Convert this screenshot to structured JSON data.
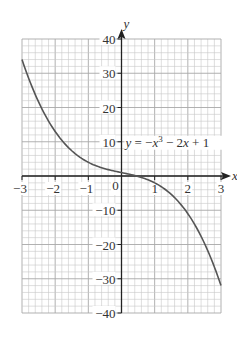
{
  "chart_data": {
    "type": "line",
    "title": "",
    "xlabel": "x",
    "ylabel": "y",
    "xlim": [
      -3,
      3
    ],
    "ylim": [
      -40,
      40
    ],
    "grid": true,
    "grid_minor_x": 0.2,
    "grid_minor_y": 2,
    "x_ticks": [
      -3,
      -2,
      -1,
      0,
      1,
      2,
      3
    ],
    "x_tick_labels": [
      "−3",
      "−2",
      "−1",
      "0",
      "1",
      "2",
      "3"
    ],
    "y_ticks": [
      40,
      30,
      20,
      10,
      -10,
      -20,
      -30,
      -40
    ],
    "y_tick_labels": [
      "40",
      "30",
      "20",
      "10",
      "−10",
      "−20",
      "−30",
      "−40"
    ],
    "annotation": "y = −x³ − 2x + 1",
    "series": [
      {
        "name": "y = -x^3 - 2x + 1",
        "x": [
          -3,
          -2.5,
          -2,
          -1.5,
          -1,
          -0.5,
          0,
          0.5,
          1,
          1.5,
          2,
          2.5,
          3
        ],
        "y": [
          34,
          21.6,
          13,
          7.4,
          4,
          2.1,
          1,
          -0.1,
          -2,
          -5.4,
          -11,
          -19.6,
          -32
        ]
      }
    ],
    "colors": {
      "curve": "#555555",
      "grid": "#c8c8c8",
      "axis": "#222222"
    }
  }
}
